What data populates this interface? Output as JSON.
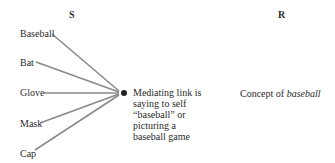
{
  "headers": {
    "stimulus": "S",
    "response": "R"
  },
  "stimuli": [
    {
      "label": "Baseball",
      "y": 34
    },
    {
      "label": "Bat",
      "y": 63
    },
    {
      "label": "Glove",
      "y": 93
    },
    {
      "label": "Mask",
      "y": 124
    },
    {
      "label": "Cap",
      "y": 154
    }
  ],
  "mediating_link": {
    "lines": [
      "Mediating link is",
      "saying to self",
      "“baseball” or",
      "picturing a",
      "baseball game"
    ]
  },
  "response": {
    "prefix": "Concept of ",
    "emphasis": "baseball"
  },
  "colors": {
    "line": "#8a8a8a",
    "dot": "#222222",
    "text": "#2a2a2a"
  }
}
